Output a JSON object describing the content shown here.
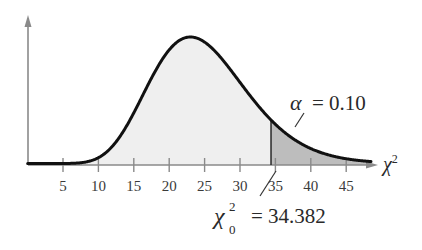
{
  "chart_data": {
    "type": "area",
    "title": "",
    "distribution": "chi-square",
    "degrees_of_freedom": 25,
    "xlabel": "χ²",
    "ylabel": "",
    "xlim": [
      0,
      49
    ],
    "x_ticks": [
      5,
      10,
      15,
      20,
      25,
      30,
      35,
      40,
      45
    ],
    "x_tick_labels": [
      "5",
      "10",
      "15",
      "20",
      "25",
      "30",
      "35",
      "40",
      "45"
    ],
    "y_ticks": [],
    "grid": false,
    "legend": null,
    "critical_value": 34.382,
    "alpha": 0.1,
    "shaded_region": {
      "from": 34.382,
      "to": 49,
      "label": "rejection region (right tail)"
    },
    "annotations": [
      {
        "text": "α = 0.10",
        "points_to": "shaded right tail"
      },
      {
        "text": "χ²₀ = 34.382",
        "points_to": "critical value on x-axis"
      }
    ],
    "colors": {
      "curve": "#111111",
      "body_fill": "#efefef",
      "tail_fill": "#bdbdbd",
      "axis": "#8a8a8a"
    }
  },
  "labels": {
    "x_axis": "χ",
    "x_axis_sup": "2",
    "alpha_symbol": "α",
    "alpha_eq": "= 0.10",
    "crit_symbol": "χ",
    "crit_sup": "2",
    "crit_sub": "0",
    "crit_eq": "= 34.382"
  }
}
